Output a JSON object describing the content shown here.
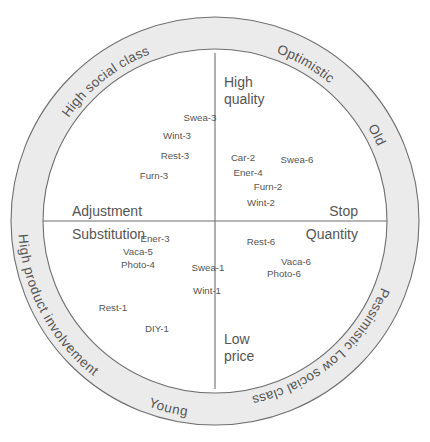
{
  "figure": {
    "type": "perceptual-map",
    "title": "",
    "center": {
      "x": 215,
      "y": 221
    },
    "ring": {
      "outer_radius": 204,
      "inner_radius": 172,
      "fill_color": "#ebebeb",
      "stroke_color": "#6f6f6f"
    }
  },
  "ring_labels": [
    {
      "id": "optimistic",
      "text": "Optimistic",
      "angle_deg": -60,
      "flip": false
    },
    {
      "id": "old",
      "text": "Old",
      "angle_deg": -28,
      "flip": false
    },
    {
      "id": "high-social-class",
      "text": "High social class",
      "angle_deg": -128,
      "flip": false
    },
    {
      "id": "pessimistic",
      "text": "Pessimistic",
      "angle_deg": 33,
      "flip": false
    },
    {
      "id": "low-social-class",
      "text": "Low social class",
      "angle_deg": 62,
      "flip": false
    },
    {
      "id": "young",
      "text": "Young",
      "angle_deg": 104,
      "flip": true
    },
    {
      "id": "high-product-involvement",
      "text": "High product involvement",
      "angle_deg": 152,
      "flip": true
    }
  ],
  "axes": {
    "top": {
      "line1": "High",
      "line2": "quality"
    },
    "bottom": {
      "line1": "Low",
      "line2": "price"
    },
    "left_upper": "Adjustment",
    "left_lower": "Substitution",
    "right_upper": "Stop",
    "right_lower": "Quantity"
  },
  "chart_data": {
    "type": "scatter",
    "title": "",
    "xlabel": "Adjustment / Substitution  ↔  Stop / Quantity",
    "ylabel": "High quality  ↔  Low price",
    "quadrant_poles": {
      "top": "High quality",
      "bottom": "Low price",
      "left": [
        "Adjustment",
        "Substitution"
      ],
      "right": [
        "Stop",
        "Quantity"
      ]
    },
    "points": [
      {
        "label": "Swea-3",
        "x": 200,
        "y": 121,
        "quadrant": "upper-left"
      },
      {
        "label": "Wint-3",
        "x": 177,
        "y": 139,
        "quadrant": "upper-left"
      },
      {
        "label": "Rest-3",
        "x": 175,
        "y": 159,
        "quadrant": "upper-left"
      },
      {
        "label": "Furn-3",
        "x": 154,
        "y": 179,
        "quadrant": "upper-left"
      },
      {
        "label": "Car-2",
        "x": 243,
        "y": 161,
        "quadrant": "upper-right"
      },
      {
        "label": "Ener-4",
        "x": 248,
        "y": 176,
        "quadrant": "upper-right"
      },
      {
        "label": "Swea-6",
        "x": 297,
        "y": 163,
        "quadrant": "upper-right"
      },
      {
        "label": "Furn-2",
        "x": 268,
        "y": 190,
        "quadrant": "upper-right"
      },
      {
        "label": "Wint-2",
        "x": 261,
        "y": 206,
        "quadrant": "upper-right"
      },
      {
        "label": "Ener-3",
        "x": 155,
        "y": 242,
        "quadrant": "lower-left"
      },
      {
        "label": "Vaca-5",
        "x": 138,
        "y": 255,
        "quadrant": "lower-left"
      },
      {
        "label": "Photo-4",
        "x": 138,
        "y": 268,
        "quadrant": "lower-left"
      },
      {
        "label": "Rest-1",
        "x": 113,
        "y": 311,
        "quadrant": "lower-left"
      },
      {
        "label": "DIY-1",
        "x": 157,
        "y": 332,
        "quadrant": "lower-left"
      },
      {
        "label": "Swea-1",
        "x": 208,
        "y": 271,
        "quadrant": "lower-center"
      },
      {
        "label": "Wint-1",
        "x": 207,
        "y": 294,
        "quadrant": "lower-center"
      },
      {
        "label": "Rest-6",
        "x": 261,
        "y": 245,
        "quadrant": "lower-right"
      },
      {
        "label": "Vaca-6",
        "x": 296,
        "y": 265,
        "quadrant": "lower-right"
      },
      {
        "label": "Photo-6",
        "x": 284,
        "y": 277,
        "quadrant": "lower-right"
      }
    ]
  }
}
